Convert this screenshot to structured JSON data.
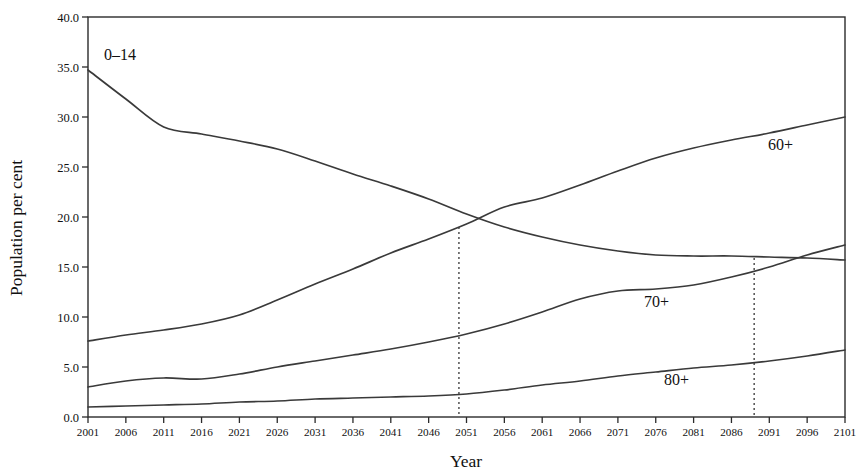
{
  "chart_data": {
    "type": "line",
    "title": "",
    "xlabel": "Year",
    "ylabel": "Population per cent",
    "xlim": [
      2001,
      2101
    ],
    "ylim": [
      0,
      40
    ],
    "grid": false,
    "legend_position": "inline-labels",
    "x_ticks": [
      2001,
      2006,
      2011,
      2016,
      2021,
      2026,
      2031,
      2036,
      2041,
      2046,
      2051,
      2056,
      2061,
      2066,
      2071,
      2076,
      2081,
      2086,
      2091,
      2096,
      2101
    ],
    "y_ticks": [
      "0.0",
      "5.0",
      "10.0",
      "15.0",
      "20.0",
      "25.0",
      "30.0",
      "35.0",
      "40.0"
    ],
    "x": [
      2001,
      2006,
      2011,
      2016,
      2021,
      2026,
      2031,
      2036,
      2041,
      2046,
      2051,
      2056,
      2061,
      2066,
      2071,
      2076,
      2081,
      2086,
      2091,
      2096,
      2101
    ],
    "series": [
      {
        "name": "0-14",
        "label": "0–14",
        "values": [
          34.7,
          31.8,
          29.0,
          28.3,
          27.6,
          26.8,
          25.6,
          24.3,
          23.1,
          21.8,
          20.3,
          19.0,
          18.0,
          17.2,
          16.6,
          16.2,
          16.1,
          16.1,
          16.0,
          15.9,
          15.7
        ]
      },
      {
        "name": "60+",
        "label": "60+",
        "values": [
          7.6,
          8.2,
          8.7,
          9.3,
          10.2,
          11.7,
          13.3,
          14.8,
          16.4,
          17.8,
          19.3,
          21.0,
          21.9,
          23.2,
          24.6,
          25.9,
          26.9,
          27.7,
          28.4,
          29.2,
          30.0
        ]
      },
      {
        "name": "70+",
        "label": "70+",
        "values": [
          3.0,
          3.6,
          3.9,
          3.8,
          4.3,
          5.0,
          5.6,
          6.2,
          6.8,
          7.5,
          8.3,
          9.3,
          10.5,
          11.8,
          12.6,
          12.8,
          13.2,
          14.0,
          15.0,
          16.2,
          17.2
        ]
      },
      {
        "name": "80+",
        "label": "80+",
        "values": [
          1.0,
          1.1,
          1.2,
          1.3,
          1.5,
          1.6,
          1.8,
          1.9,
          2.0,
          2.1,
          2.3,
          2.7,
          3.2,
          3.6,
          4.1,
          4.5,
          4.9,
          5.2,
          5.6,
          6.1,
          6.7
        ]
      }
    ],
    "annotations": [
      {
        "name": "crossover-0-14-and-60plus",
        "x": 2050,
        "y": 19.0,
        "style": "dotted-vertical",
        "from_y": 0
      },
      {
        "name": "crossover-0-14-and-70plus",
        "x": 2089,
        "y": 15.9,
        "style": "dotted-vertical",
        "from_y": 0
      }
    ]
  }
}
